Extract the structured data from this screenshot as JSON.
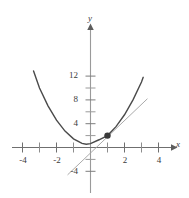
{
  "chart_data": {
    "type": "line",
    "title": "",
    "xlabel": "x",
    "ylabel": "y",
    "xlim": [
      -5.0,
      5.2
    ],
    "ylim": [
      -5.2,
      14.0
    ],
    "grid": false,
    "legend": null,
    "x_ticks": [
      -4,
      -3,
      -2,
      -1,
      1,
      2,
      3,
      4
    ],
    "x_tick_labels": [
      "-4",
      "",
      "-2",
      "",
      "",
      "2",
      "",
      "4"
    ],
    "y_ticks": [
      2,
      4,
      6,
      8,
      10,
      12,
      -2,
      -4
    ],
    "y_tick_labels": [
      "",
      "4",
      "",
      "8",
      "",
      "12",
      "",
      "-4"
    ],
    "series": [
      {
        "name": "parabola",
        "type": "curve",
        "color": "#4a4a4a",
        "width": 1.4,
        "equation": "y = x^2 + x + 1",
        "x_range": [
          -3.35,
          3.1
        ],
        "points": [
          [
            -3.35,
            12.87
          ],
          [
            -3.0,
            10.0
          ],
          [
            -2.5,
            7.0
          ],
          [
            -2.0,
            4.6
          ],
          [
            -1.5,
            2.75
          ],
          [
            -1.0,
            1.45
          ],
          [
            -0.5,
            0.7
          ],
          [
            -0.25,
            0.55
          ],
          [
            0.0,
            0.65
          ],
          [
            0.5,
            1.3
          ],
          [
            1.0,
            2.0
          ],
          [
            1.5,
            3.5
          ],
          [
            2.0,
            5.5
          ],
          [
            2.5,
            8.0
          ],
          [
            3.0,
            11.0
          ],
          [
            3.1,
            11.8
          ]
        ]
      },
      {
        "name": "tangent-line",
        "type": "line",
        "color": "#a0a0a0",
        "width": 0.9,
        "equation": "y = 2x",
        "endpoints": [
          [
            -1.35,
            -4.6
          ],
          [
            3.35,
            8.2
          ]
        ]
      }
    ],
    "annotations": [
      {
        "name": "tangency-point",
        "type": "point",
        "x": 1.0,
        "y": 2.0,
        "color": "#3a3a3a",
        "size": 3.2
      }
    ],
    "axes": {
      "x_axis_color": "#6b6b6b",
      "y_axis_color": "#8a8a8a",
      "arrow_x": true,
      "arrow_y": true
    }
  },
  "labels": {
    "x_axis": "x",
    "y_axis": "y",
    "y_12": "12",
    "y_8": "8",
    "y_4": "4",
    "y_neg4": "-4",
    "x_neg4": "-4",
    "x_neg2": "-2",
    "x_2": "2",
    "x_4": "4"
  }
}
